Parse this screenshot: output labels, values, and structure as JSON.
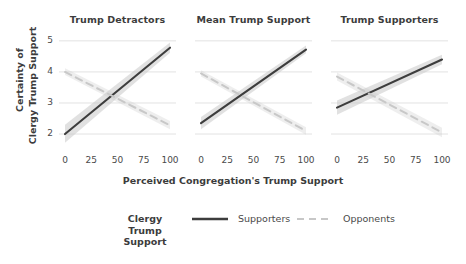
{
  "chart_data": {
    "type": "line",
    "title": "",
    "xlabel": "Perceived Congregation's Trump Support",
    "ylabel_line1": "Certainty of",
    "ylabel_line2": "Clergy Trump Support",
    "xlim": [
      0,
      100
    ],
    "ylim": [
      1.55,
      5.35
    ],
    "xticks": [
      0,
      25,
      50,
      75,
      100
    ],
    "xtick_labels": [
      "0",
      "25",
      "50",
      "75",
      "100"
    ],
    "yticks": [
      2,
      3,
      4,
      5
    ],
    "ytick_labels": [
      "2",
      "3",
      "4",
      "5"
    ],
    "grid": "horizontal",
    "legend_position": "bottom",
    "legend_title": "Clergy\nTrump\nSupport",
    "legend_title_lines": [
      "Clergy",
      "Trump",
      "Support"
    ],
    "legend_entries": [
      {
        "name": "Supporters",
        "style": "solid",
        "color": "#3d3d3d"
      },
      {
        "name": "Opponents",
        "style": "dashed",
        "color": "#c7c7c7"
      }
    ],
    "colors": {
      "solid_line": "#3d3d3d",
      "dashed_line": "#c8c8c8",
      "ribbon": "#c9c9c9",
      "gridline": "#e2e2e2",
      "text": "#3c3c3c"
    },
    "facets": [
      {
        "label": "Trump Detractors",
        "series": [
          {
            "name": "Supporters",
            "style": "solid",
            "x": [
              0,
              100
            ],
            "y": [
              2.0,
              4.78
            ],
            "ci_lower": [
              1.72,
              4.62
            ],
            "ci_upper": [
              2.3,
              4.95
            ]
          },
          {
            "name": "Opponents",
            "style": "dashed",
            "x": [
              0,
              100
            ],
            "y": [
              4.0,
              2.28
            ],
            "ci_lower": [
              3.9,
              2.15
            ],
            "ci_upper": [
              4.12,
              2.42
            ]
          }
        ]
      },
      {
        "label": "Mean Trump Support",
        "series": [
          {
            "name": "Supporters",
            "style": "solid",
            "x": [
              0,
              100
            ],
            "y": [
              2.35,
              4.72
            ],
            "ci_lower": [
              2.15,
              4.6
            ],
            "ci_upper": [
              2.55,
              4.85
            ]
          },
          {
            "name": "Opponents",
            "style": "dashed",
            "x": [
              0,
              100
            ],
            "y": [
              3.95,
              2.1
            ],
            "ci_lower": [
              3.85,
              1.98
            ],
            "ci_upper": [
              4.05,
              2.22
            ]
          }
        ]
      },
      {
        "label": "Trump Supporters",
        "series": [
          {
            "name": "Supporters",
            "style": "solid",
            "x": [
              0,
              100
            ],
            "y": [
              2.85,
              4.4
            ],
            "ci_lower": [
              2.62,
              4.25
            ],
            "ci_upper": [
              3.08,
              4.55
            ]
          },
          {
            "name": "Opponents",
            "style": "dashed",
            "x": [
              0,
              100
            ],
            "y": [
              3.85,
              2.05
            ],
            "ci_lower": [
              3.72,
              1.9
            ],
            "ci_upper": [
              3.98,
              2.2
            ]
          }
        ]
      }
    ]
  }
}
